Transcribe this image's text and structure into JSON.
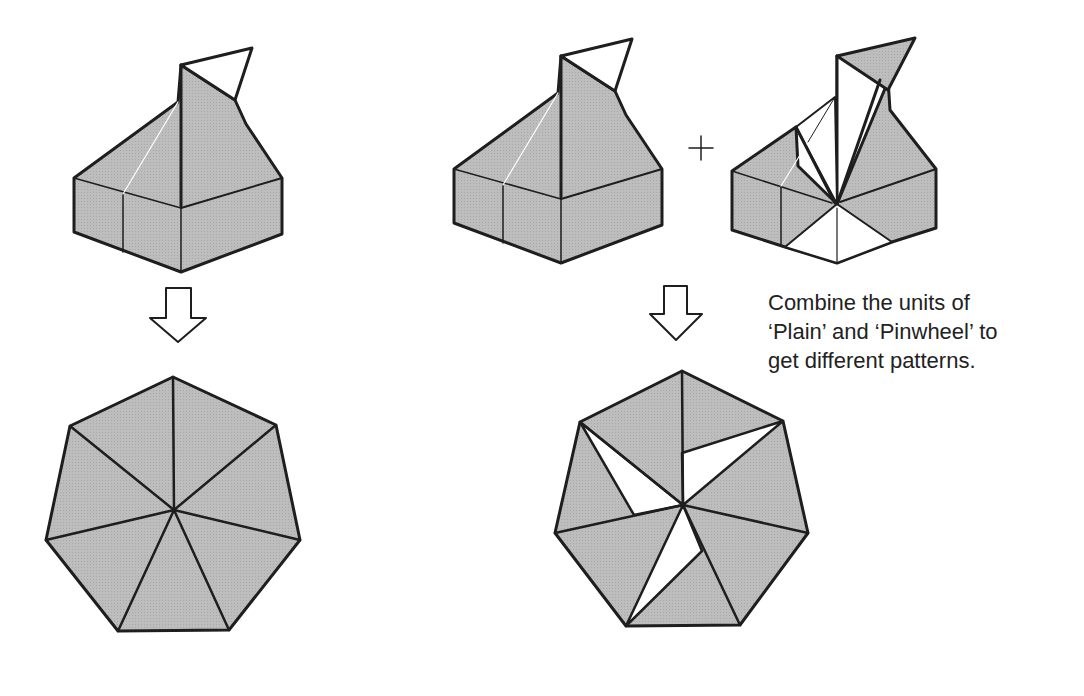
{
  "caption": {
    "lines": [
      "Combine the units of",
      "‘Plain’ and ‘Pinwheel’ to",
      "get different patterns."
    ]
  },
  "colors": {
    "fill": "#b8b8b8",
    "stroke": "#1e1e1e",
    "paper": "#ffffff"
  },
  "figures": {
    "left_unit": "plain-unit",
    "right_units": [
      "plain-unit",
      "pinwheel-unit"
    ],
    "operator": "+",
    "arrows": [
      "down-arrow",
      "down-arrow"
    ],
    "results": [
      "plain-heptagon",
      "pinwheel-heptagon"
    ]
  }
}
